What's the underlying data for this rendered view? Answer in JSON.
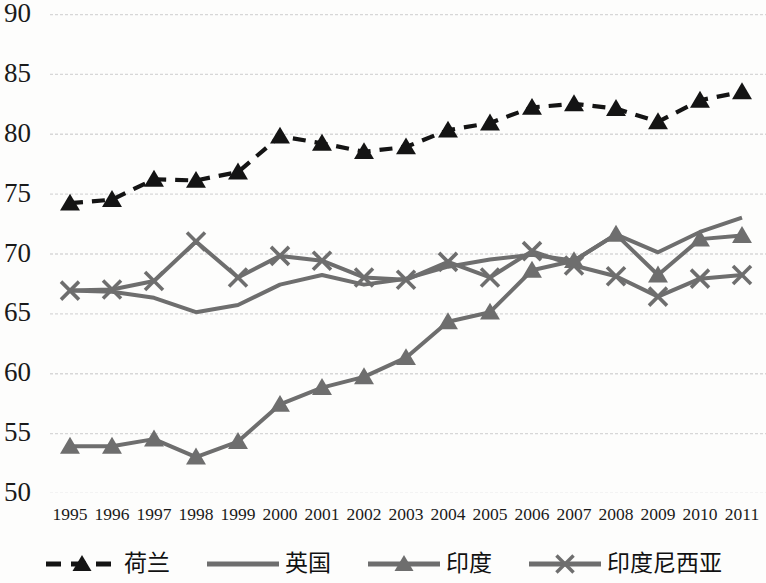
{
  "chart_data": {
    "type": "line",
    "title": "",
    "xlabel": "",
    "ylabel": "",
    "ylim": [
      50,
      90
    ],
    "ytick_step": 5,
    "yticks": [
      90,
      85,
      80,
      75,
      70,
      65,
      60,
      55,
      50
    ],
    "grid": true,
    "legend_position": "bottom",
    "categories": [
      1995,
      1996,
      1997,
      1998,
      1999,
      2000,
      2001,
      2002,
      2003,
      2004,
      2005,
      2006,
      2007,
      2008,
      2009,
      2010,
      2011
    ],
    "x": [
      "1995",
      "1996",
      "1997",
      "1998",
      "1999",
      "2000",
      "2001",
      "2002",
      "2003",
      "2004",
      "2005",
      "2006",
      "2007",
      "2008",
      "2009",
      "2010",
      "2011"
    ],
    "series": [
      {
        "name": "荷兰",
        "name_en": "Netherlands",
        "color": "#141414",
        "marker": "triangle",
        "dash": "dashed",
        "values": [
          74.2,
          74.5,
          76.2,
          76.1,
          76.8,
          79.8,
          79.2,
          78.5,
          78.9,
          80.3,
          80.9,
          82.2,
          82.5,
          82.1,
          81.0,
          82.8,
          83.5
        ]
      },
      {
        "name": "英国",
        "name_en": "United Kingdom",
        "color": "#6e6e6e",
        "marker": "none",
        "dash": "solid",
        "values": [
          66.9,
          66.8,
          66.3,
          65.1,
          65.7,
          67.4,
          68.2,
          67.4,
          67.9,
          68.9,
          69.5,
          69.9,
          69.4,
          71.6,
          70.1,
          71.8,
          73.0
        ]
      },
      {
        "name": "印度",
        "name_en": "India",
        "color": "#6e6e6e",
        "marker": "triangle",
        "dash": "solid",
        "values": [
          53.9,
          53.9,
          54.5,
          53.0,
          54.3,
          57.4,
          58.8,
          59.7,
          61.3,
          64.3,
          65.1,
          68.6,
          69.4,
          71.6,
          68.2,
          71.2,
          71.5
        ]
      },
      {
        "name": "印度尼西亚",
        "name_en": "Indonesia",
        "color": "#6e6e6e",
        "marker": "x",
        "dash": "solid",
        "values": [
          66.9,
          67.0,
          67.7,
          71.0,
          68.0,
          69.8,
          69.4,
          68.0,
          67.8,
          69.3,
          68.0,
          70.2,
          69.0,
          68.1,
          66.4,
          67.9,
          68.2
        ]
      }
    ]
  },
  "style": {
    "grid_color": "#d7d7d7",
    "background": "#fdfdfc",
    "text_color": "#1a1a1a"
  }
}
